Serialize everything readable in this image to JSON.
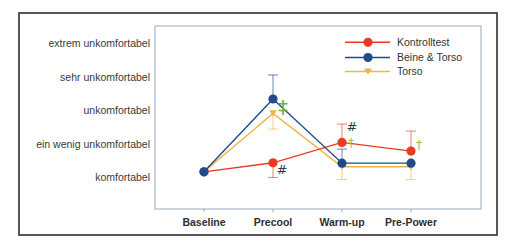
{
  "chart_data": {
    "type": "line",
    "title": "",
    "xlabel": "",
    "ylabel": "",
    "categories": [
      "Baseline",
      "Precool",
      "Warm-up",
      "Pre-Power"
    ],
    "y_tick_values": [
      1,
      2,
      3,
      4,
      5
    ],
    "y_tick_labels": [
      "komfortabel",
      "ein wenig unkomfortabel",
      "unkomfortabel",
      "sehr unkomfortabel",
      "extrem unkomfortabel"
    ],
    "ylim": [
      0.05,
      5.55
    ],
    "grid": false,
    "legend_position": "upper right",
    "series": [
      {
        "name": "Torso",
        "color": "#f2b244",
        "marker": "triangle-down",
        "values": [
          1.17,
          2.92,
          1.32,
          1.32
        ],
        "error": [
          null,
          0.47,
          0.38,
          0.38
        ],
        "error_direction": [
          null,
          "down",
          "down",
          "down"
        ]
      },
      {
        "name": "Kontrolltest",
        "color": "#ec3a22",
        "marker": "circle",
        "values": [
          1.17,
          1.44,
          2.05,
          1.79
        ],
        "error": [
          null,
          0.44,
          0.55,
          0.6
        ],
        "error_direction": [
          null,
          "down",
          "up",
          "up"
        ]
      },
      {
        "name": "Beine & Torso",
        "color": "#1f4b8a",
        "marker": "circle",
        "values": [
          1.17,
          3.35,
          1.43,
          1.43
        ],
        "error": [
          null,
          0.72,
          0.42,
          null
        ],
        "error_direction": [
          null,
          "up",
          "up",
          null
        ]
      }
    ],
    "legend_order": [
      "Kontrolltest",
      "Beine & Torso",
      "Torso"
    ],
    "annotations": [
      {
        "text": "#",
        "category_index": 1,
        "y": 1.25,
        "dx": 9,
        "color": "#3a3a3a",
        "size": 13
      },
      {
        "text": "‡",
        "category_index": 1,
        "y": 3.11,
        "dx": 10,
        "color": "#7aaa4c",
        "size": 20
      },
      {
        "text": "#",
        "category_index": 2,
        "y": 2.52,
        "dx": 10,
        "color": "#3a3a3a",
        "size": 13
      },
      {
        "text": "†",
        "category_index": 2,
        "y": 2.05,
        "dx": 9,
        "color": "#8cbf6a",
        "size": 12
      },
      {
        "text": "†",
        "category_index": 3,
        "y": 1.97,
        "dx": 8,
        "color": "#8cbf6a",
        "size": 12
      }
    ]
  }
}
